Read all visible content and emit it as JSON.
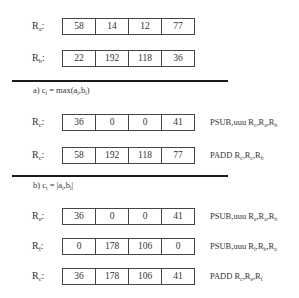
{
  "inputs": {
    "rows": [
      {
        "label": "R",
        "sub": "a",
        "values": [
          "58",
          "14",
          "12",
          "77"
        ]
      },
      {
        "label": "R",
        "sub": "b",
        "values": [
          "22",
          "192",
          "118",
          "36"
        ]
      }
    ]
  },
  "section_a": {
    "prefix": "a) c",
    "prefix_sub": "i",
    "formula_mid": " = max(a",
    "formula_sub1": "i",
    "formula_comma": ",b",
    "formula_sub2": "i",
    "formula_end": ")",
    "rows": [
      {
        "label": "R",
        "sub": "c",
        "values": [
          "36",
          "0",
          "0",
          "41"
        ],
        "instr_op": "PSUB,uuu R",
        "instr_args": [
          {
            "sub": "c",
            "sep": ",R"
          },
          {
            "sub": "a",
            "sep": ",R"
          },
          {
            "sub": "b",
            "sep": ""
          }
        ]
      },
      {
        "label": "R",
        "sub": "c",
        "values": [
          "58",
          "192",
          "118",
          "77"
        ],
        "instr_op": "PADD R",
        "instr_args": [
          {
            "sub": "c",
            "sep": ",R"
          },
          {
            "sub": "c",
            "sep": ",R"
          },
          {
            "sub": "b",
            "sep": ""
          }
        ]
      }
    ]
  },
  "section_b": {
    "prefix": "b) c",
    "prefix_sub": "i",
    "formula_mid": " = |a",
    "formula_sub1": "i",
    "formula_comma": ",b",
    "formula_sub2": "i",
    "formula_end": "|",
    "rows": [
      {
        "label": "R",
        "sub": "e",
        "values": [
          "36",
          "0",
          "0",
          "41"
        ],
        "instr_op": "PSUB,uuu R",
        "instr_args": [
          {
            "sub": "e",
            "sep": ",R"
          },
          {
            "sub": "a",
            "sep": ",R"
          },
          {
            "sub": "b",
            "sep": ""
          }
        ]
      },
      {
        "label": "R",
        "sub": "f",
        "values": [
          "0",
          "178",
          "106",
          "0"
        ],
        "instr_op": "PSUB,uuu R",
        "instr_args": [
          {
            "sub": "f",
            "sep": ",R"
          },
          {
            "sub": "b",
            "sep": ",R"
          },
          {
            "sub": "a",
            "sep": ""
          }
        ]
      },
      {
        "label": "R",
        "sub": "c",
        "values": [
          "36",
          "178",
          "106",
          "41"
        ],
        "instr_op": "PADD R",
        "instr_args": [
          {
            "sub": "c",
            "sep": ",R"
          },
          {
            "sub": "e",
            "sep": ",R"
          },
          {
            "sub": "f",
            "sep": ""
          }
        ]
      }
    ]
  },
  "label_colon": ":"
}
